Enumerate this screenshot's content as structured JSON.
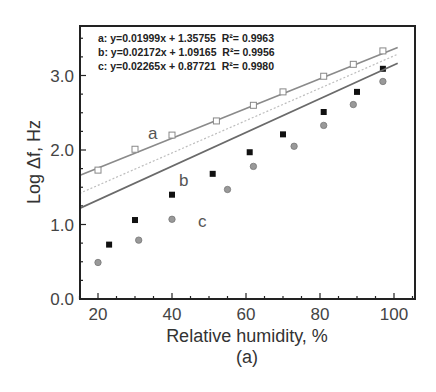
{
  "chart_data": {
    "type": "scatter",
    "title": "",
    "subtitle": "(a)",
    "xlabel": "Relative humidity, %",
    "ylabel": "Log Δf, Hz",
    "xlim": [
      15,
      105
    ],
    "ylim": [
      0,
      3.65
    ],
    "xticks": [
      20,
      40,
      60,
      80,
      100
    ],
    "yticks": [
      0.0,
      1.0,
      2.0,
      3.0
    ],
    "xtick_labels": [
      "20",
      "40",
      "60",
      "80",
      "100"
    ],
    "ytick_labels": [
      "0.0",
      "1.0",
      "2.0",
      "3.0"
    ],
    "grid": false,
    "legend_position": "top-left inset box",
    "series": [
      {
        "name": "a",
        "marker": "open-square",
        "color": "#8a8a8a",
        "fit": {
          "slope": 0.01999,
          "intercept": 1.35755,
          "r2": 0.9963,
          "label": "a: y=0.01999x + 1.35755  R²= 0.9963"
        },
        "x": [
          20,
          30,
          40,
          52,
          62,
          70,
          81,
          89,
          97
        ],
        "y": [
          1.73,
          2.01,
          2.2,
          2.39,
          2.6,
          2.78,
          2.99,
          3.15,
          3.33
        ]
      },
      {
        "name": "b",
        "marker": "filled-square",
        "color": "#111111",
        "fit": {
          "slope": 0.02172,
          "intercept": 1.09165,
          "r2": 0.9956,
          "label": "b: y=0.02172x + 1.09165  R²= 0.9956"
        },
        "x": [
          23,
          30,
          40,
          51,
          61,
          70,
          81,
          90,
          97
        ],
        "y": [
          0.73,
          1.06,
          1.4,
          1.68,
          1.97,
          2.21,
          2.51,
          2.78,
          3.09
        ]
      },
      {
        "name": "c",
        "marker": "gray-circle",
        "color": "#777777",
        "fit": {
          "slope": 0.02265,
          "intercept": 0.87721,
          "r2": 0.998,
          "label": "c: y=0.02265x + 0.87721  R²= 0.9980"
        },
        "x": [
          20,
          31,
          40,
          55,
          62,
          73,
          81,
          89,
          97
        ],
        "y": [
          0.49,
          0.79,
          1.07,
          1.47,
          1.78,
          2.05,
          2.33,
          2.61,
          2.92
        ]
      }
    ]
  },
  "labels": {
    "eq_a": "a: y=0.01999x + 1.35755  R²= 0.9963",
    "eq_b": "b: y=0.02172x + 1.09165  R²= 0.9956",
    "eq_c": "c: y=0.02265x + 0.87721  R²= 0.9980",
    "series_a": "a",
    "series_b": "b",
    "series_c": "c",
    "xlabel": "Relative humidity, %",
    "ylabel": "Log Δf, Hz",
    "panel": "(a)",
    "x0": "20",
    "x1": "40",
    "x2": "60",
    "x3": "80",
    "x4": "100",
    "y0": "0.0",
    "y1": "1.0",
    "y2": "2.0",
    "y3": "3.0"
  }
}
